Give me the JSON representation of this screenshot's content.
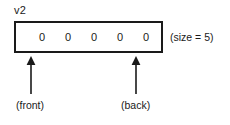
{
  "diagram": {
    "variable_label": "v2",
    "size_annotation": "(size = 5)",
    "container": {
      "elements": [
        "0",
        "0",
        "0",
        "0",
        "0"
      ],
      "element_count": 5
    },
    "pointers": [
      {
        "name": "front",
        "label": "(front)",
        "icon": "arrow-up-icon",
        "target_index": 0
      },
      {
        "name": "back",
        "label": "(back)",
        "icon": "arrow-up-icon",
        "target_index": 4
      }
    ],
    "colors": {
      "stroke": "#1a1a1a",
      "background": "#ffffff",
      "text": "#1a1a1a"
    }
  }
}
